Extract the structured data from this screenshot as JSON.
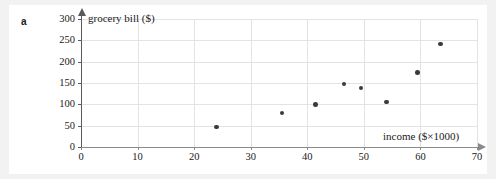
{
  "part_label": "a",
  "chart_data": {
    "type": "scatter",
    "title": "",
    "xlabel": "income ($×1000)",
    "ylabel": "grocery bill ($)",
    "xlim": [
      0,
      70
    ],
    "ylim": [
      0,
      300
    ],
    "xticks": [
      0,
      10,
      20,
      30,
      40,
      50,
      60,
      70
    ],
    "yticks": [
      0,
      50,
      100,
      150,
      200,
      250,
      300
    ],
    "xtick_labels": [
      "0",
      "10",
      "20",
      "30",
      "40",
      "50",
      "60",
      "70"
    ],
    "ytick_labels": [
      "0",
      "50",
      "100",
      "150",
      "200",
      "250",
      "300"
    ],
    "grid": true,
    "legend": null,
    "series": [
      {
        "name": "households",
        "points": [
          {
            "x": 24.0,
            "y": 47
          },
          {
            "x": 35.5,
            "y": 80
          },
          {
            "x": 41.5,
            "y": 100
          },
          {
            "x": 46.5,
            "y": 148
          },
          {
            "x": 49.5,
            "y": 138
          },
          {
            "x": 54.0,
            "y": 105
          },
          {
            "x": 59.5,
            "y": 175
          },
          {
            "x": 63.5,
            "y": 241
          }
        ]
      }
    ],
    "marker_color": "#3a3a3a",
    "grid_color": "#e3e3e3",
    "axis_color": "#5a5a5a"
  }
}
